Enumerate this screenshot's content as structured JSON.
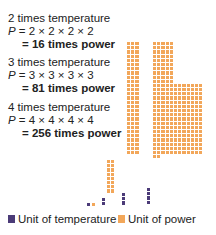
{
  "blocks": [
    {
      "title": "2 times temperature",
      "formula_p": "P",
      "formula_rest": " = 2 × 2 × 2 × 2",
      "result": "= 16 times power"
    },
    {
      "title": "3 times temperature",
      "formula_p": "P",
      "formula_rest": " = 3 × 3 × 3 × 3",
      "result": "= 81 times power"
    },
    {
      "title": "4 times temperature",
      "formula_p": "P",
      "formula_rest": " = 4 × 4 × 4 × 4",
      "result": "= 256 times power"
    }
  ],
  "legend": {
    "temperature": {
      "label": "Unit of temperature",
      "color": "#4b3b78"
    },
    "power": {
      "label": "Unit of power",
      "color": "#f2a75a"
    }
  },
  "colors": {
    "temperature": "#4b3b78",
    "power": "#f2a75a"
  },
  "chart_data": {
    "type": "bar",
    "categories": [
      "1×",
      "2×",
      "3×",
      "4×"
    ],
    "series": [
      {
        "name": "Unit of temperature",
        "values": [
          1,
          2,
          3,
          4
        ]
      },
      {
        "name": "Unit of power",
        "values": [
          1,
          16,
          81,
          256
        ]
      }
    ],
    "title": "",
    "xlabel": "",
    "ylabel": ""
  }
}
